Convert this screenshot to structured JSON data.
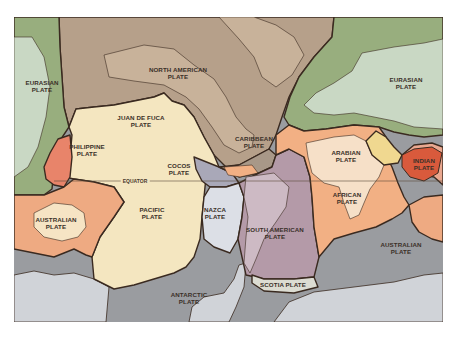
{
  "map": {
    "title": "Tectonic plates world map",
    "colors": {
      "eurasian_dark": "#98ae7e",
      "eurasian_light": "#c9d8c4",
      "north_american": "#b6a08a",
      "north_american_land": "#c8b29a",
      "pacific": "#f4e6c0",
      "philippine": "#e8846a",
      "cocos": "#a9a8b8",
      "caribbean": "#a89888",
      "nazca": "#dcdfe6",
      "south_american": "#b49aa8",
      "south_american_land": "#cdbac4",
      "african": "#f2b084",
      "african_land": "#f6e0c8",
      "arabian": "#f0d890",
      "indian": "#d95a3c",
      "indian_land": "#eaa890",
      "australian": "#eeaa82",
      "australian_land": "#f6e4c4",
      "scotia": "#dcdcd2",
      "antarctic": "#9a9ca0",
      "antarctica_land": "#d0d3d8",
      "boundary": "#3a2a20",
      "background": "#ffffff"
    },
    "labels": {
      "eurasian_west": [
        "EURASIAN",
        "PLATE"
      ],
      "north_american": [
        "NORTH AMERICAN",
        "PLATE"
      ],
      "juan_de_fuca": [
        "JUAN DE FUCA",
        "PLATE"
      ],
      "philippine": [
        "PHILIPPINE",
        "PLATE"
      ],
      "cocos": [
        "COCOS",
        "PLATE"
      ],
      "caribbean": [
        "CARIBBEAN",
        "PLATE"
      ],
      "eurasian_east": [
        "EURASIAN",
        "PLATE"
      ],
      "arabian": [
        "ARABIAN",
        "PLATE"
      ],
      "indian": [
        "INDIAN",
        "PLATE"
      ],
      "african": [
        "AFRICAN",
        "PLATE"
      ],
      "australian_west": [
        "AUSTRALIAN",
        "PLATE"
      ],
      "pacific": [
        "PACIFIC",
        "PLATE"
      ],
      "nazca": [
        "NAZCA",
        "PLATE"
      ],
      "south_american": [
        "SOUTH AMERICAN",
        "PLATE"
      ],
      "scotia": [
        "SCOTIA PLATE"
      ],
      "australian_east": [
        "AUSTRALIAN",
        "PLATE"
      ],
      "antarctic": [
        "ANTARCTIC",
        "PLATE"
      ]
    },
    "equator_label": "EQUATOR"
  }
}
